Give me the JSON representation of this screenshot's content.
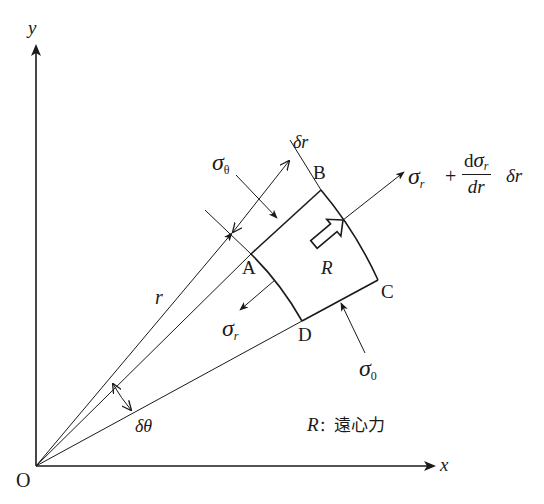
{
  "diagram": {
    "axes": {
      "x_label": "x",
      "y_label": "y",
      "origin_label": "O"
    },
    "points": {
      "A": "A",
      "B": "B",
      "C": "C",
      "D": "D"
    },
    "labels": {
      "r": "r",
      "delta_r": "δr",
      "delta_theta": "δθ",
      "sigma_theta_main": "σ",
      "sigma_theta_sub": "θ",
      "sigma_0_main": "σ",
      "sigma_0_sub": "0",
      "sigma_r_main": "σ",
      "sigma_r_sub": "r",
      "R": "R",
      "outer_sigma_main": "σ",
      "outer_sigma_sub": "r",
      "plus": "+",
      "frac_num_d": "d",
      "frac_num_sigma": "σ",
      "frac_num_sub": "r",
      "frac_den": "dr",
      "delta_r_tail": "δr"
    },
    "legend": {
      "symbol": "R",
      "separator": "：",
      "text": "遠心力"
    },
    "colors": {
      "line": "#1a1a1a",
      "background": "#ffffff"
    }
  }
}
